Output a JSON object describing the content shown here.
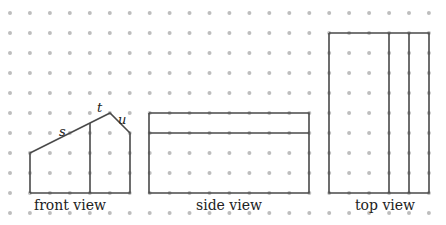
{
  "grid": {
    "cols": 22,
    "rows": 11,
    "x0": 10,
    "y0": 13,
    "spacing": 19.95,
    "dot_color": "#bdbdbd",
    "dot_radius": 2
  },
  "line_color": "#4a4a4a",
  "views": [
    {
      "id": "front",
      "label": "front view",
      "label_pos": [
        70,
        210
      ],
      "paths": [
        [
          [
            30,
            193
          ],
          [
            30,
            153
          ],
          [
            110,
            113
          ],
          [
            130,
            133
          ],
          [
            130,
            193
          ],
          [
            30,
            193
          ]
        ],
        [
          [
            90,
            123
          ],
          [
            90,
            193
          ]
        ]
      ],
      "edge_labels": [
        {
          "text": "s",
          "pos": [
            59,
            136
          ]
        },
        {
          "text": "t",
          "pos": [
            97,
            112
          ]
        },
        {
          "text": "u",
          "pos": [
            118,
            124
          ]
        }
      ]
    },
    {
      "id": "side",
      "label": "side view",
      "label_pos": [
        229,
        210
      ],
      "paths": [
        [
          [
            149,
            113
          ],
          [
            309,
            113
          ],
          [
            309,
            193
          ],
          [
            149,
            193
          ],
          [
            149,
            113
          ]
        ],
        [
          [
            149,
            133
          ],
          [
            309,
            133
          ]
        ]
      ],
      "edge_labels": []
    },
    {
      "id": "top",
      "label": "top view",
      "label_pos": [
        385,
        210
      ],
      "paths": [
        [
          [
            329,
            33
          ],
          [
            429,
            33
          ],
          [
            429,
            193
          ],
          [
            329,
            193
          ],
          [
            329,
            33
          ]
        ],
        [
          [
            389,
            33
          ],
          [
            389,
            193
          ]
        ],
        [
          [
            409,
            33
          ],
          [
            409,
            193
          ]
        ]
      ],
      "edge_labels": []
    }
  ]
}
